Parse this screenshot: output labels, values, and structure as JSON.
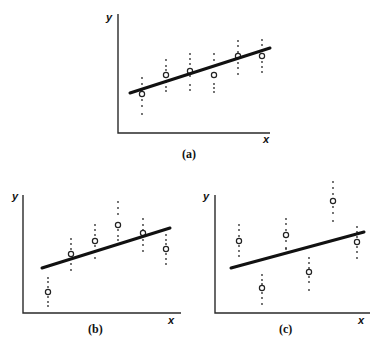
{
  "figure": {
    "panels": [
      {
        "id": "a",
        "caption": "(a)",
        "y_label": "y",
        "x_label": "x",
        "axes": {
          "x0": 118,
          "y_top": 14,
          "y0": 133,
          "x_end": 270
        },
        "labels": {
          "y": [
            106,
            21
          ],
          "x": [
            263,
            143
          ],
          "caption": [
            182,
            158
          ]
        },
        "line": [
          130,
          93,
          270,
          48
        ],
        "groups": [
          {
            "x": 142,
            "mean": 94,
            "dots": [
              78,
              84,
              90,
              100,
              106,
              114
            ]
          },
          {
            "x": 166,
            "mean": 75,
            "dots": [
              60,
              66,
              70,
              82,
              87,
              91
            ]
          },
          {
            "x": 190,
            "mean": 71,
            "dots": [
              54,
              59,
              64,
              76,
              85,
              90
            ]
          },
          {
            "x": 214,
            "mean": 75,
            "dots": [
              54,
              60,
              66,
              84,
              88,
              92
            ]
          },
          {
            "x": 238,
            "mean": 56,
            "dots": [
              41,
              46,
              52,
              63,
              68,
              74
            ]
          },
          {
            "x": 262,
            "mean": 56,
            "dots": [
              40,
              45,
              51,
              62,
              67,
              72
            ]
          }
        ]
      },
      {
        "id": "b",
        "caption": "(b)",
        "y_label": "y",
        "x_label": "x",
        "axes": {
          "x0": 23,
          "y_top": 195,
          "y0": 313,
          "x_end": 181
        },
        "labels": {
          "y": [
            12,
            200
          ],
          "x": [
            168,
            324
          ],
          "caption": [
            88,
            333
          ]
        },
        "line": [
          42,
          268,
          170,
          228
        ],
        "groups": [
          {
            "x": 48,
            "mean": 292,
            "dots": [
              278,
              282,
              287,
              297,
              302,
              306
            ]
          },
          {
            "x": 71,
            "mean": 254,
            "dots": [
              239,
              244,
              249,
              259,
              264,
              270
            ]
          },
          {
            "x": 95,
            "mean": 241,
            "dots": [
              225,
              230,
              235,
              246,
              251,
              258
            ]
          },
          {
            "x": 118,
            "mean": 225,
            "dots": [
              202,
              208,
              214,
              230,
              236,
              240
            ]
          },
          {
            "x": 143,
            "mean": 233,
            "dots": [
              219,
              225,
              230,
              240,
              245,
              251
            ]
          },
          {
            "x": 166,
            "mean": 249,
            "dots": [
              235,
              240,
              244,
              254,
              259,
              264
            ]
          }
        ]
      },
      {
        "id": "c",
        "caption": "(c)",
        "y_label": "y",
        "x_label": "x",
        "axes": {
          "x0": 215,
          "y_top": 195,
          "y0": 313,
          "x_end": 370
        },
        "labels": {
          "y": [
            203,
            200
          ],
          "x": [
            358,
            324
          ],
          "caption": [
            279,
            333
          ]
        },
        "line": [
          231,
          268,
          364,
          232
        ],
        "groups": [
          {
            "x": 239,
            "mean": 241,
            "dots": [
              225,
              230,
              236,
              246,
              251,
              256
            ]
          },
          {
            "x": 262,
            "mean": 288,
            "dots": [
              275,
              280,
              284,
              293,
              298,
              304
            ]
          },
          {
            "x": 286,
            "mean": 235,
            "dots": [
              219,
              224,
              230,
              241,
              248,
              249
            ]
          },
          {
            "x": 309,
            "mean": 272,
            "dots": [
              258,
              263,
              268,
              277,
              282,
              290
            ]
          },
          {
            "x": 333,
            "mean": 201,
            "dots": [
              182,
              188,
              194,
              207,
              213,
              221
            ]
          },
          {
            "x": 357,
            "mean": 242,
            "dots": [
              227,
              232,
              237,
              247,
              252,
              258
            ]
          }
        ]
      }
    ]
  }
}
